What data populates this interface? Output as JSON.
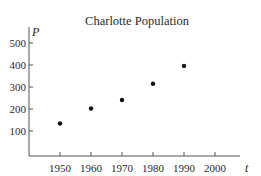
{
  "chart_data": {
    "type": "scatter",
    "title": "Charlotte Population",
    "xlabel": "t",
    "ylabel": "P",
    "x": [
      1950,
      1960,
      1970,
      1980,
      1990
    ],
    "values": [
      134,
      202,
      241,
      315,
      396
    ],
    "xticks": [
      1950,
      1960,
      1970,
      1980,
      1990,
      2000
    ],
    "yticks": [
      100,
      200,
      300,
      400,
      500
    ],
    "xlim": [
      1940,
      2010
    ],
    "ylim": [
      0,
      550
    ],
    "grid": false,
    "legend": null
  },
  "colors": {
    "axis": "#555555",
    "point": "#111111",
    "text": "#2a2a2a"
  }
}
